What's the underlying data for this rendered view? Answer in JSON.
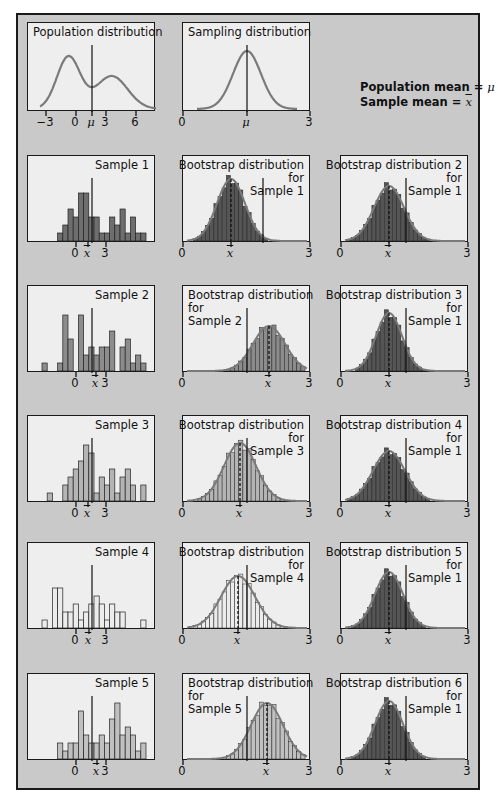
{
  "figure": {
    "background_color": "#c9c9c9",
    "panel_color": "#eeeeee",
    "curve_color": "#7a7a7a",
    "legend": {
      "line1_label": "Population mean = ",
      "line1_symbol": "μ",
      "line2_label": "Sample mean = ",
      "line2_symbol": "x̄"
    }
  },
  "panels": {
    "population": {
      "title": "Population distribution",
      "ticks": [
        "−3",
        "0",
        "μ",
        "3",
        "6"
      ]
    },
    "sampling": {
      "title": "Sampling distribution",
      "ticks": [
        "0",
        "μ",
        "3"
      ]
    },
    "sample1": {
      "title": "Sample 1",
      "ticks": [
        "0",
        "x̄",
        "3"
      ],
      "fill": "#6e6e6e"
    },
    "sample2": {
      "title": "Sample 2",
      "ticks": [
        "0",
        "x̄",
        "3"
      ],
      "fill": "#8c8c8c"
    },
    "sample3": {
      "title": "Sample 3",
      "ticks": [
        "0",
        "x̄",
        "3"
      ],
      "fill": "#b4b4b4"
    },
    "sample4": {
      "title": "Sample 4",
      "ticks": [
        "0",
        "x̄",
        "3"
      ],
      "fill": "#ececec"
    },
    "sample5": {
      "title": "Sample 5",
      "ticks": [
        "0",
        "x̄",
        "3"
      ],
      "fill": "#c0c0c0"
    },
    "boot_s1": {
      "title": "Bootstrap distribution\nfor\nSample 1",
      "ticks": [
        "0",
        "x̄",
        "3"
      ]
    },
    "boot2_s1": {
      "title": "Bootstrap distribution 2\nfor\nSample 1",
      "ticks": [
        "0",
        "x̄",
        "3"
      ]
    },
    "boot_s2": {
      "title": "Bootstrap distribution\nfor\nSample 2",
      "ticks": [
        "0",
        "x̄",
        "3"
      ]
    },
    "boot3_s1": {
      "title": "Bootstrap distribution 3\nfor\nSample 1",
      "ticks": [
        "0",
        "x̄",
        "3"
      ]
    },
    "boot_s3": {
      "title": "Bootstrap distribution\nfor\nSample 3",
      "ticks": [
        "0",
        "x̄",
        "3"
      ]
    },
    "boot4_s1": {
      "title": "Bootstrap distribution 4\nfor\nSample 1",
      "ticks": [
        "0",
        "x̄",
        "3"
      ]
    },
    "boot_s4": {
      "title": "Bootstrap distribution\nfor\nSample 4",
      "ticks": [
        "0",
        "x̄",
        "3"
      ]
    },
    "boot5_s1": {
      "title": "Bootstrap distribution 5\nfor\nSample 1",
      "ticks": [
        "0",
        "x̄",
        "3"
      ]
    },
    "boot_s5": {
      "title": "Bootstrap distribution\nfor\nSample 5",
      "ticks": [
        "0",
        "x̄",
        "3"
      ]
    },
    "boot6_s1": {
      "title": "Bootstrap distribution 6\nfor\nSample 1",
      "ticks": [
        "0",
        "x̄",
        "3"
      ]
    }
  },
  "histograms": {
    "sample1": [
      0,
      0,
      0,
      1,
      2,
      4,
      3,
      6,
      6,
      3,
      3,
      1,
      1,
      3,
      2,
      4,
      1,
      3,
      1,
      1
    ],
    "sample2": [
      0,
      0,
      1,
      0,
      0,
      1,
      7,
      4,
      0,
      7,
      2,
      3,
      2,
      3,
      3,
      5,
      0,
      3,
      4,
      1,
      2,
      1
    ],
    "sample3": [
      0,
      1,
      0,
      0,
      2,
      3,
      4,
      5,
      7,
      6,
      1,
      3,
      2,
      4,
      1,
      3,
      4,
      2,
      0,
      2
    ],
    "sample4": [
      0,
      0,
      1,
      0,
      5,
      5,
      2,
      2,
      3,
      1,
      2,
      3,
      4,
      3,
      1,
      3,
      2,
      2,
      0,
      0,
      0,
      1
    ],
    "sample5": [
      0,
      0,
      2,
      1,
      2,
      2,
      6,
      3,
      2,
      2,
      3,
      2,
      5,
      7,
      3,
      4,
      3,
      1,
      2
    ]
  }
}
